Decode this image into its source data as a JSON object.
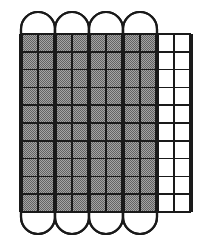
{
  "figure": {
    "name": "shaded-grid-with-capsules",
    "background_color": "#ffffff",
    "line_color": "#1a1a1a",
    "shaded_fill_color": "#8c8c8c",
    "empty_fill_color": "#ffffff",
    "fraction_shaded": "80/100",
    "fraction_shaded_simplified": "4/5",
    "percent_shaded": "80%",
    "decimal_shaded": "0.8"
  },
  "grid": {
    "name": "unit-grid",
    "columns": 10,
    "rows": 10,
    "total_cells": 100,
    "shaded_columns": 8,
    "empty_columns": 2,
    "shaded_cells": 80,
    "empty_cells": 20,
    "left_px": 21,
    "top_px": 34,
    "right_px": 191,
    "bottom_px": 212,
    "cell_width_px": 17,
    "cell_height_px": 17.8,
    "thin_line_width_px": 1.6,
    "thick_line_width_px": 3.2,
    "thick_divider_every_n_columns": 2,
    "column_fill_states": [
      "shaded",
      "shaded",
      "shaded",
      "shaded",
      "shaded",
      "shaded",
      "shaded",
      "shaded",
      "empty",
      "empty"
    ]
  },
  "capsules": {
    "name": "capsule-tubes",
    "count": 4,
    "columns_per_capsule": 2,
    "width_px": 34,
    "cap_radius_px": 17,
    "top_px": 12,
    "bottom_px": 236,
    "stroke_width_px": 2.2,
    "fill": "none",
    "items": [
      {
        "index": 1,
        "left_px": 21,
        "covers_columns": [
          1,
          2
        ]
      },
      {
        "index": 2,
        "left_px": 55,
        "covers_columns": [
          3,
          4
        ]
      },
      {
        "index": 3,
        "left_px": 89,
        "covers_columns": [
          5,
          6
        ]
      },
      {
        "index": 4,
        "left_px": 123,
        "covers_columns": [
          7,
          8
        ]
      }
    ]
  }
}
